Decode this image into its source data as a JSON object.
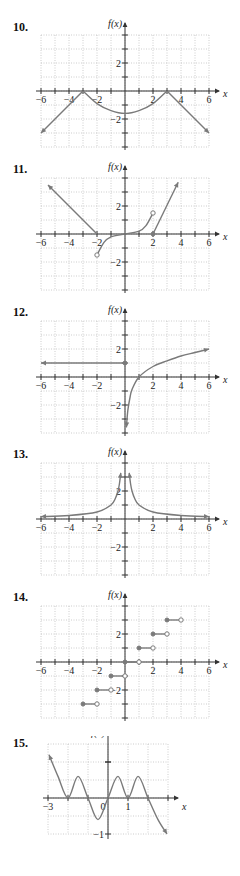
{
  "colors": {
    "curve": "#7a7a7a",
    "axis": "#333333",
    "grid": "#b8b8b8"
  },
  "chart_data": [
    {
      "id": "10",
      "label": "10.",
      "type": "line",
      "xlabel": "x",
      "ylabel": "f(x)",
      "xlim": [
        -6,
        6
      ],
      "ylim": [
        -4,
        4
      ],
      "x_tick_labels": [
        "−6",
        "−4",
        "−2",
        "2",
        "4",
        "6"
      ],
      "y_tick_labels": [
        "2",
        "−2"
      ],
      "grid": true,
      "series": [
        {
          "name": "left ray",
          "points": [
            [
              -6,
              -3
            ],
            [
              -3,
              0
            ]
          ],
          "arrow_start": true
        },
        {
          "name": "middle arc",
          "points": [
            [
              -3,
              0
            ],
            [
              -2,
              -0.9
            ],
            [
              -1,
              -1.4
            ],
            [
              0,
              -1.6
            ],
            [
              1,
              -1.4
            ],
            [
              2,
              -0.9
            ],
            [
              3,
              0
            ]
          ]
        },
        {
          "name": "right ray",
          "points": [
            [
              3,
              0
            ],
            [
              6,
              -3
            ]
          ],
          "arrow_end": true
        }
      ]
    },
    {
      "id": "11",
      "label": "11.",
      "type": "line",
      "xlabel": "x",
      "ylabel": "f(x)",
      "xlim": [
        -6,
        6
      ],
      "ylim": [
        -4,
        4
      ],
      "x_tick_labels": [
        "−6",
        "−4",
        "−2",
        "2",
        "4",
        "6"
      ],
      "y_tick_labels": [
        "2",
        "−2"
      ],
      "grid": true,
      "series": [
        {
          "name": "left ray",
          "points": [
            [
              -5.5,
              3.5
            ],
            [
              -2,
              0
            ]
          ],
          "arrow_start": true
        },
        {
          "name": "cubic",
          "points": [
            [
              -2,
              -1.5
            ],
            [
              -1.5,
              -0.6
            ],
            [
              -1,
              -0.2
            ],
            [
              0,
              0
            ],
            [
              1,
              0.2
            ],
            [
              1.5,
              0.6
            ],
            [
              2,
              1.5
            ]
          ]
        },
        {
          "name": "right ray",
          "points": [
            [
              2,
              0
            ],
            [
              3.8,
              3.7
            ]
          ],
          "arrow_end": true
        }
      ],
      "markers": [
        {
          "x": -2,
          "y": -1.5,
          "type": "open"
        },
        {
          "x": 2,
          "y": 1.5,
          "type": "open"
        },
        {
          "x": 2,
          "y": 0,
          "type": "closed"
        }
      ]
    },
    {
      "id": "12",
      "label": "12.",
      "type": "line",
      "xlabel": "x",
      "ylabel": "f(x)",
      "xlim": [
        -6,
        6
      ],
      "ylim": [
        -4,
        4
      ],
      "x_tick_labels": [
        "−6",
        "−4",
        "−2",
        "2",
        "4",
        "6"
      ],
      "y_tick_labels": [
        "2",
        "−2"
      ],
      "grid": true,
      "series": [
        {
          "name": "constant ray",
          "points": [
            [
              0,
              1
            ],
            [
              -6,
              1
            ]
          ],
          "arrow_end": true
        },
        {
          "name": "log curve",
          "points": [
            [
              0.1,
              -3.6
            ],
            [
              0.2,
              -2.4
            ],
            [
              0.35,
              -1.5
            ],
            [
              0.5,
              -0.9
            ],
            [
              1,
              0
            ],
            [
              2,
              0.75
            ],
            [
              3,
              1.15
            ],
            [
              4,
              1.5
            ],
            [
              5,
              1.75
            ],
            [
              6,
              2
            ]
          ],
          "arrow_start": true,
          "arrow_end": true
        }
      ],
      "markers": [
        {
          "x": 0,
          "y": 1,
          "type": "closed"
        }
      ]
    },
    {
      "id": "13",
      "label": "13.",
      "type": "line",
      "xlabel": "x",
      "ylabel": "f(x)",
      "xlim": [
        -6,
        6
      ],
      "ylim": [
        -4,
        4
      ],
      "x_tick_labels": [
        "−6",
        "−4",
        "−2",
        "2",
        "4",
        "6"
      ],
      "y_tick_labels": [
        "2",
        "−2"
      ],
      "grid": true,
      "series": [
        {
          "name": "left branch",
          "points": [
            [
              -6,
              0.17
            ],
            [
              -4,
              0.25
            ],
            [
              -2,
              0.5
            ],
            [
              -1,
              1
            ],
            [
              -0.7,
              1.45
            ],
            [
              -0.5,
              2
            ],
            [
              -0.4,
              2.5
            ],
            [
              -0.3,
              3.3
            ]
          ],
          "arrow_start": true,
          "arrow_end": true
        },
        {
          "name": "right branch",
          "points": [
            [
              0.3,
              3.3
            ],
            [
              0.4,
              2.5
            ],
            [
              0.5,
              2
            ],
            [
              0.7,
              1.45
            ],
            [
              1,
              1
            ],
            [
              2,
              0.5
            ],
            [
              4,
              0.25
            ],
            [
              6,
              0.17
            ]
          ],
          "arrow_start": true,
          "arrow_end": true
        }
      ]
    },
    {
      "id": "14",
      "label": "14.",
      "type": "line",
      "xlabel": "x",
      "ylabel": "f(x)",
      "xlim": [
        -6,
        6
      ],
      "ylim": [
        -4,
        4
      ],
      "x_tick_labels": [
        "−6",
        "−4",
        "−2",
        "2",
        "4",
        "6"
      ],
      "y_tick_labels": [
        "2",
        "−2"
      ],
      "grid": true,
      "steps": [
        {
          "x0": -3,
          "x1": -2,
          "y": -3
        },
        {
          "x0": -2,
          "x1": -1,
          "y": -2
        },
        {
          "x0": -1,
          "x1": 0,
          "y": -1
        },
        {
          "x0": 0,
          "x1": 1,
          "y": 0
        },
        {
          "x0": 1,
          "x1": 2,
          "y": 1
        },
        {
          "x0": 2,
          "x1": 3,
          "y": 2
        },
        {
          "x0": 3,
          "x1": 4,
          "y": 3
        }
      ]
    },
    {
      "id": "15",
      "label": "15.",
      "type": "line",
      "xlabel": "x",
      "ylabel": "f(x)",
      "xlim": [
        -3,
        3
      ],
      "ylim": [
        -1,
        1.5
      ],
      "x_tick_labels": [
        "−3",
        "0",
        "1"
      ],
      "y_tick_labels": [
        "−1"
      ],
      "grid": true,
      "series": [
        {
          "name": "oscillating curve",
          "points": [
            [
              -2.95,
              1.2
            ],
            [
              -2.5,
              0.6
            ],
            [
              -2,
              0
            ],
            [
              -1.5,
              0.6
            ],
            [
              -1,
              0
            ],
            [
              -0.5,
              -0.6
            ],
            [
              0,
              0
            ],
            [
              0.5,
              0.6
            ],
            [
              1,
              0
            ],
            [
              1.5,
              0.6
            ],
            [
              2,
              0
            ],
            [
              2.5,
              -0.6
            ],
            [
              2.95,
              -1
            ]
          ],
          "arrow_start": true,
          "arrow_end": true
        }
      ]
    }
  ]
}
